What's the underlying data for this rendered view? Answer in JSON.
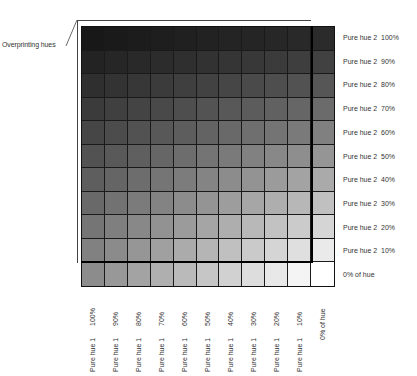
{
  "callout": {
    "label": "Overprinting hues"
  },
  "grid": {
    "columns": 11,
    "rows": 11,
    "hue1_levels": [
      100,
      90,
      80,
      70,
      60,
      50,
      40,
      30,
      20,
      10,
      0
    ],
    "hue2_levels": [
      100,
      90,
      80,
      70,
      60,
      50,
      40,
      30,
      20,
      10,
      0
    ],
    "line_color": "#1a1a1a",
    "outline_color": "#000000"
  },
  "right_labels": [
    {
      "name": "Pure hue 2",
      "pct": "100%"
    },
    {
      "name": "Pure hue 2",
      "pct": "90%"
    },
    {
      "name": "Pure hue 2",
      "pct": "80%"
    },
    {
      "name": "Pure hue 2",
      "pct": "70%"
    },
    {
      "name": "Pure hue 2",
      "pct": "60%"
    },
    {
      "name": "Pure hue 2",
      "pct": "50%"
    },
    {
      "name": "Pure hue 2",
      "pct": "40%"
    },
    {
      "name": "Pure hue 2",
      "pct": "30%"
    },
    {
      "name": "Pure hue 2",
      "pct": "20%"
    },
    {
      "name": "Pure hue 2",
      "pct": "10%"
    },
    {
      "name": "0% of hue",
      "pct": ""
    }
  ],
  "bottom_labels": [
    {
      "pct": "100%",
      "name": "Pure hue 1"
    },
    {
      "pct": "90%",
      "name": "Pure hue 1"
    },
    {
      "pct": "80%",
      "name": "Pure hue 1"
    },
    {
      "pct": "70%",
      "name": "Pure hue 1"
    },
    {
      "pct": "60%",
      "name": "Pure hue 1"
    },
    {
      "pct": "50%",
      "name": "Pure hue 1"
    },
    {
      "pct": "40%",
      "name": "Pure hue 1"
    },
    {
      "pct": "30%",
      "name": "Pure hue 1"
    },
    {
      "pct": "20%",
      "name": "Pure hue 1"
    },
    {
      "pct": "10%",
      "name": "Pure hue 1"
    },
    {
      "pct": "0% of hue",
      "name": ""
    }
  ]
}
